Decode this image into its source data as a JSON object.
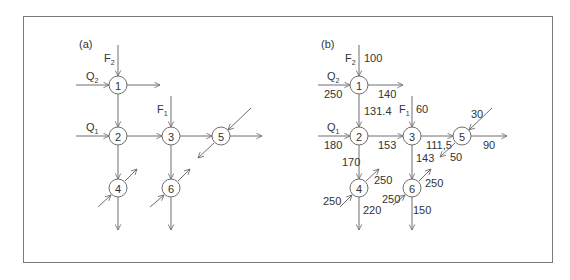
{
  "panels": [
    {
      "label": "(a)",
      "nodes": [
        "1",
        "2",
        "3",
        "4",
        "5",
        "6"
      ],
      "inputs": {
        "F2": "F",
        "F2_sub": "2",
        "Q2": "Q",
        "Q2_sub": "2",
        "Q1": "Q",
        "Q1_sub": "1",
        "F1": "F",
        "F1_sub": "1"
      }
    },
    {
      "label": "(b)",
      "nodes": [
        "1",
        "2",
        "3",
        "4",
        "5",
        "6"
      ],
      "inputs": {
        "F2": "F",
        "F2_sub": "2",
        "Q2": "Q",
        "Q2_sub": "2",
        "Q1": "Q",
        "Q1_sub": "1",
        "F1": "F",
        "F1_sub": "1"
      },
      "flows": {
        "F2_in": "100",
        "Q2_in": "250",
        "out_1": "140",
        "e_1_2": "131.4",
        "F1_in": "60",
        "Q1_in": "180",
        "e_2_3": "153",
        "e_3_5": "111,5",
        "in_5": "30",
        "out_5_down": "50",
        "out_5_right": "90",
        "e_2_4": "170",
        "e_3_6": "143",
        "out_4_diag": "250",
        "in_4_diag": "250",
        "out_4_down": "220",
        "out_6_diag": "250",
        "in_6_diag": "250",
        "out_6_down": "150"
      }
    }
  ],
  "colors": {
    "line": "#6e6e6e",
    "text": "#333333",
    "frame": "#7a7a7a"
  }
}
